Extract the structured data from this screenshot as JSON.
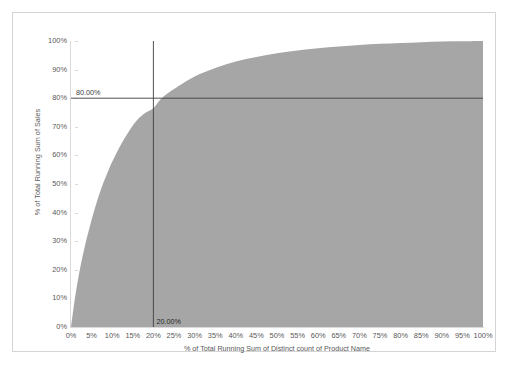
{
  "chart_data": {
    "type": "area",
    "title": "",
    "xlabel": "% of Total Running Sum of Distinct count of Product Name",
    "ylabel": "% of Total Running Sum of Sales",
    "xlim": [
      0,
      100
    ],
    "ylim": [
      0,
      100
    ],
    "grid": false,
    "legend": "none",
    "fill_color": "#a6a6a6",
    "axis_color": "#d9d9d9",
    "tick_label_color": "#595959",
    "reference_line_color": "#404040",
    "x_tick_labels": [
      "0%",
      "5%",
      "10%",
      "15%",
      "20%",
      "25%",
      "30%",
      "35%",
      "40%",
      "45%",
      "50%",
      "55%",
      "60%",
      "65%",
      "70%",
      "75%",
      "80%",
      "85%",
      "90%",
      "95%",
      "100%"
    ],
    "x_tick_values": [
      0,
      5,
      10,
      15,
      20,
      25,
      30,
      35,
      40,
      45,
      50,
      55,
      60,
      65,
      70,
      75,
      80,
      85,
      90,
      95,
      100
    ],
    "y_tick_labels": [
      "100%",
      "90%",
      "80%",
      "70%",
      "60%",
      "50%",
      "40%",
      "30%",
      "20%",
      "10%",
      "0%"
    ],
    "y_tick_values": [
      100,
      90,
      80,
      70,
      60,
      50,
      40,
      30,
      20,
      10,
      0
    ],
    "series": [
      {
        "name": "% of Total Running Sum of Sales",
        "x": [
          0,
          1,
          2,
          3,
          4,
          5,
          6,
          7,
          8,
          9,
          10,
          12,
          14,
          16,
          18,
          20,
          22,
          25,
          30,
          35,
          40,
          45,
          50,
          55,
          60,
          65,
          70,
          75,
          80,
          85,
          90,
          95,
          100
        ],
        "values": [
          0,
          10.5,
          19.0,
          26.0,
          32.0,
          37.5,
          42.5,
          47.0,
          51.0,
          54.5,
          57.8,
          63.5,
          68.3,
          72.3,
          74.8,
          76.5,
          80.0,
          83.2,
          87.6,
          90.6,
          92.8,
          94.4,
          95.7,
          96.7,
          97.5,
          98.1,
          98.6,
          99.0,
          99.3,
          99.6,
          99.8,
          99.9,
          100.0
        ]
      }
    ],
    "reference_lines": [
      {
        "name": "horizontal-80-percent",
        "orientation": "horizontal",
        "value": 80,
        "label": "80.00%"
      },
      {
        "name": "vertical-20-percent",
        "orientation": "vertical",
        "value": 20,
        "label": "20.00%"
      }
    ]
  }
}
